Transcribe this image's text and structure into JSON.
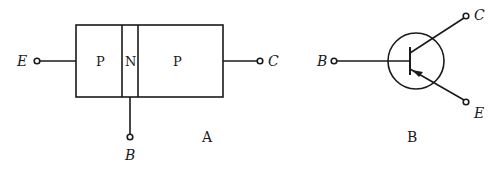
{
  "diagram_a": {
    "caption": "A",
    "regions": [
      "P",
      "N",
      "P"
    ],
    "terminals": {
      "emitter": "E",
      "collector": "C",
      "base": "B"
    }
  },
  "diagram_b": {
    "caption": "B",
    "terminals": {
      "base": "B",
      "collector": "C",
      "emitter": "E"
    }
  },
  "colors": {
    "ink": "#1a1a1a",
    "background": "#ffffff"
  }
}
